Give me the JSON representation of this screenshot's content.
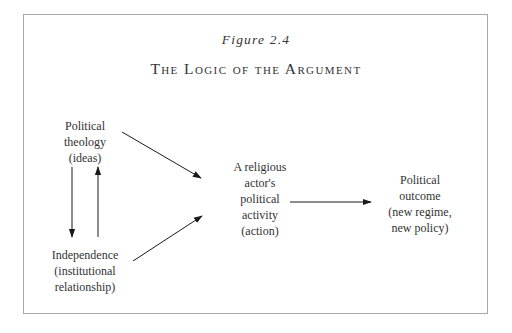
{
  "figure": {
    "label": "Figure 2.4",
    "title": "The Logic of the Argument"
  },
  "nodes": {
    "ideas": {
      "lines": [
        "Political",
        "theology",
        "(ideas)"
      ]
    },
    "independence": {
      "lines": [
        "Independence",
        "(institutional",
        "relationship)"
      ]
    },
    "action": {
      "lines": [
        "A religious",
        "actor's",
        "political",
        "activity",
        "(action)"
      ]
    },
    "outcome": {
      "lines": [
        "Political",
        "outcome",
        "(new regime,",
        "new policy)"
      ]
    }
  },
  "edges": [
    {
      "from": "ideas",
      "to": "action"
    },
    {
      "from": "independence",
      "to": "action"
    },
    {
      "from": "ideas",
      "to": "independence"
    },
    {
      "from": "independence",
      "to": "ideas"
    },
    {
      "from": "action",
      "to": "outcome"
    }
  ],
  "colors": {
    "frame": "#a8a8a8",
    "text": "#333333",
    "arrow": "#1a1a1a"
  }
}
